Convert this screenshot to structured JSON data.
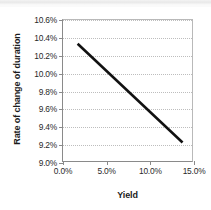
{
  "chart_data": {
    "type": "line",
    "title": "",
    "xlabel": "Yield",
    "ylabel": "Rate of change of duration",
    "xlim": [
      0.0,
      15.0
    ],
    "ylim": [
      9.0,
      10.6
    ],
    "grid": true,
    "legend": false,
    "x_tick_labels": [
      "0.0%",
      "5.0%",
      "10.0%",
      "15.0%"
    ],
    "x_tick_values": [
      0.0,
      5.0,
      10.0,
      15.0
    ],
    "y_tick_labels": [
      "9.0%",
      "9.2%",
      "9.4%",
      "9.6%",
      "9.8%",
      "10.0%",
      "10.2%",
      "10.4%",
      "10.6%"
    ],
    "y_tick_values": [
      9.0,
      9.2,
      9.4,
      9.6,
      9.8,
      10.0,
      10.2,
      10.4,
      10.6
    ],
    "series": [
      {
        "name": "Rate of change of duration",
        "color": "#111111",
        "line_width": 2.6,
        "x": [
          1.7,
          13.9
        ],
        "y": [
          10.33,
          9.21
        ]
      }
    ]
  },
  "axis_title_color": "#1b1b1b",
  "tick_label_color": "#2a2a2a",
  "gridline_color": "#bdbdbd",
  "axis_line_color": "#8a8a8a"
}
